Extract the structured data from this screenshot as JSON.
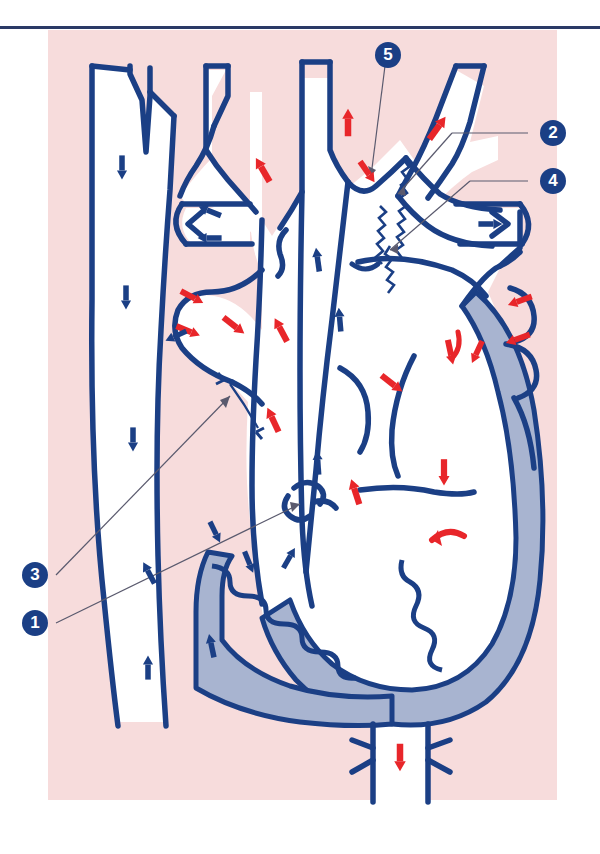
{
  "figure": {
    "panel_background": "#f7dcdc",
    "page_background": "#ffffff",
    "outline_color": "#1b3f85",
    "arterial_arrow_color": "#e8262a",
    "venous_arrow_color": "#1b3f85",
    "myocardium_fill": "#a8b4d0",
    "lumen_fill": "#ffffff",
    "rule_color": "#2a3a66",
    "leader_line_color": "#5a5a6e"
  },
  "callouts": [
    {
      "id": "1",
      "label": "1",
      "x": 22,
      "y": 610,
      "leader_to_x": 300,
      "leader_to_y": 500
    },
    {
      "id": "2",
      "label": "2",
      "x": 540,
      "y": 120,
      "leader_to_x": 400,
      "leader_to_y": 190
    },
    {
      "id": "3",
      "label": "3",
      "x": 22,
      "y": 562,
      "leader_to_x": 228,
      "leader_to_y": 392
    },
    {
      "id": "4",
      "label": "4",
      "x": 540,
      "y": 168,
      "leader_to_x": 392,
      "leader_to_y": 246
    },
    {
      "id": "5",
      "label": "5",
      "x": 375,
      "y": 42,
      "leader_to_x": 371,
      "leader_to_y": 172
    }
  ],
  "arrows": {
    "red_count": 19,
    "blue_count": 16,
    "red_meaning": "oxygenated / arterial flow direction",
    "blue_meaning": "deoxygenated / venous flow direction"
  }
}
